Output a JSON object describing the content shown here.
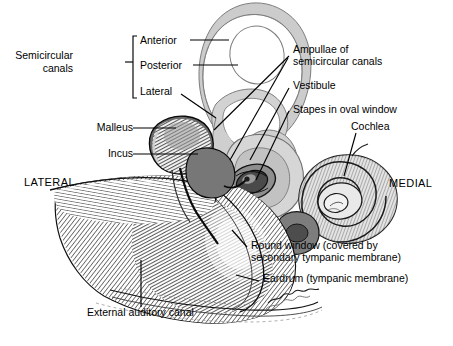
{
  "figure": {
    "orientation": {
      "lateral": "LATERAL",
      "medial": "MEDIAL"
    },
    "palette": {
      "ink": "#000000",
      "background": "#ffffff",
      "inner_ear_fill": "#c9c9c9",
      "inner_ear_fill_light": "#dcdcdc",
      "bone_dark": "#6b6b6b",
      "bone_mid": "#9a9a9a",
      "hatch": "#2a2a2a"
    },
    "group_labels": [
      {
        "id": "semicircular-canals",
        "text_line1": "Semicircular",
        "text_line2": "canals",
        "members": [
          "Anterior",
          "Posterior",
          "Lateral"
        ]
      }
    ],
    "labels": [
      {
        "id": "semicircular-canals-line1",
        "text": "Semicircular",
        "x": 73,
        "y": 55
      },
      {
        "id": "semicircular-canals-line2",
        "text": "canals",
        "x": 73,
        "y": 68
      },
      {
        "id": "anterior",
        "text": "Anterior",
        "x": 144,
        "y": 43
      },
      {
        "id": "posterior",
        "text": "Posterior",
        "x": 144,
        "y": 68
      },
      {
        "id": "lateral-canal",
        "text": "Lateral",
        "x": 144,
        "y": 92
      },
      {
        "id": "malleus",
        "text": "Malleus",
        "x": 84,
        "y": 124
      },
      {
        "id": "incus",
        "text": "Incus",
        "x": 101,
        "y": 150
      },
      {
        "id": "lateral-direction",
        "text": "LATERAL",
        "x": 24,
        "y": 181
      },
      {
        "id": "medial-direction",
        "text": "MEDIAL",
        "x": 392,
        "y": 182
      },
      {
        "id": "ampullae-line1",
        "text": "Ampullae of",
        "x": 294,
        "y": 49
      },
      {
        "id": "ampullae-line2",
        "text": "semicircular canals",
        "x": 294,
        "y": 61
      },
      {
        "id": "vestibule",
        "text": "Vestibule",
        "x": 294,
        "y": 85
      },
      {
        "id": "stapes",
        "text": "Stapes in oval window",
        "x": 294,
        "y": 108
      },
      {
        "id": "cochlea",
        "text": "Cochlea",
        "x": 352,
        "y": 126
      },
      {
        "id": "round-window-line1",
        "text": "Round window (covered by",
        "x": 252,
        "y": 245
      },
      {
        "id": "round-window-line2",
        "text": "secondary tympanic membrane)",
        "x": 252,
        "y": 257
      },
      {
        "id": "eardrum",
        "text": "Eardrum (tympanic membrane)",
        "x": 264,
        "y": 278
      },
      {
        "id": "external-auditory-canal",
        "text": "External auditory canal",
        "x": 88,
        "y": 312
      }
    ],
    "structures": [
      "anterior semicircular canal",
      "posterior semicircular canal",
      "lateral semicircular canal",
      "ampullae of semicircular canals",
      "vestibule",
      "stapes in oval window",
      "cochlea",
      "round window",
      "malleus",
      "incus",
      "eardrum (tympanic membrane)",
      "external auditory canal",
      "temporal bone"
    ]
  }
}
